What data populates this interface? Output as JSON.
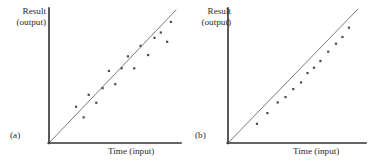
{
  "figure": {
    "background_color": "#ffffff",
    "axis_color": "#303030",
    "trend_line_color": "#6b6b6b",
    "point_color": "#4a4a4a"
  },
  "chart_data": [
    {
      "type": "scatter",
      "title": "",
      "panel_label": "(a)",
      "xlabel": "Time (input)",
      "ylabel_line1": "Result",
      "ylabel_line2": "(output)",
      "xlim": [
        0,
        100
      ],
      "ylim": [
        0,
        100
      ],
      "grid": false,
      "legend": "none",
      "trend_line": {
        "name": "trend line",
        "x": [
          0,
          100
        ],
        "y": [
          0,
          100
        ]
      },
      "series": [
        {
          "name": "observations",
          "x": [
            21,
            27,
            31,
            37,
            42,
            47,
            52,
            57,
            62,
            67,
            72,
            78,
            83,
            88,
            93,
            96
          ],
          "y": [
            27,
            19,
            36,
            30,
            41,
            54,
            44,
            56,
            65,
            56,
            73,
            66,
            79,
            83,
            76,
            91
          ]
        }
      ],
      "annotation": "Points scatter on both sides of the line"
    },
    {
      "type": "scatter",
      "title": "",
      "panel_label": "(b)",
      "xlabel": "Time (input)",
      "ylabel_line1": "Result",
      "ylabel_line2": "(output)",
      "xlim": [
        0,
        100
      ],
      "ylim": [
        0,
        100
      ],
      "grid": false,
      "legend": "none",
      "trend_line": {
        "name": "trend line",
        "x": [
          0,
          100
        ],
        "y": [
          0,
          100
        ]
      },
      "series": [
        {
          "name": "observations",
          "x": [
            22,
            30,
            38,
            44,
            50,
            56,
            61,
            66,
            71,
            77,
            83,
            88,
            93
          ],
          "y": [
            14,
            22,
            30,
            34,
            40,
            45,
            52,
            56,
            61,
            68,
            74,
            79,
            86
          ]
        }
      ],
      "annotation": "Points fall consistently below the line"
    }
  ]
}
